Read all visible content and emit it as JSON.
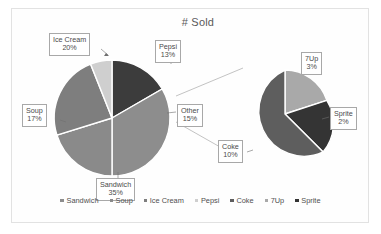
{
  "chart_data": {
    "type": "pie",
    "title": "# Sold",
    "subtype": "pie-of-pie",
    "xlabel": "",
    "ylabel": "",
    "legend_position": "bottom",
    "grid": false,
    "categories": [
      "Sandwich",
      "Soup",
      "Ice Cream",
      "Pepsi",
      "Other"
    ],
    "values": [
      35,
      17,
      20,
      13,
      15
    ],
    "value_unit": "%",
    "primary_pie": {
      "slices": [
        {
          "label": "Sandwich",
          "value": 35,
          "display": "35%",
          "color": "#8d8d8d"
        },
        {
          "label": "Soup",
          "value": 17,
          "display": "17%",
          "color": "#8a8a8a"
        },
        {
          "label": "Ice Cream",
          "value": 20,
          "display": "20%",
          "color": "#7e7e7e"
        },
        {
          "label": "Pepsi",
          "value": 13,
          "display": "13%",
          "color": "#cfcfcf"
        },
        {
          "label": "Other",
          "value": 15,
          "display": "15%",
          "color": "#3c3c3c"
        }
      ]
    },
    "secondary_pie": {
      "source_slice": "Other",
      "source_value": 15,
      "slices": [
        {
          "label": "Coke",
          "value": 10,
          "display": "10%",
          "color": "#5e5e5e"
        },
        {
          "label": "7Up",
          "value": 3,
          "display": "3%",
          "color": "#a9a9a9"
        },
        {
          "label": "Sprite",
          "value": 2,
          "display": "2%",
          "color": "#343434"
        }
      ]
    },
    "legend": [
      "Sandwich",
      "Soup",
      "Ice Cream",
      "Pepsi",
      "Coke",
      "7Up",
      "Sprite"
    ],
    "annotations": [
      "Ice Cream 20%",
      "Pepsi 13%",
      "Soup 17%",
      "Other 15%",
      "Sandwich 35%",
      "7Up 3%",
      "Sprite 2%",
      "Coke 10%"
    ]
  },
  "labels": {
    "ice_cream": {
      "name": "Ice Cream",
      "pct": "20%"
    },
    "pepsi": {
      "name": "Pepsi",
      "pct": "13%"
    },
    "soup": {
      "name": "Soup",
      "pct": "17%"
    },
    "other": {
      "name": "Other",
      "pct": "15%"
    },
    "sandwich": {
      "name": "Sandwich",
      "pct": "35%"
    },
    "sevenup": {
      "name": "7Up",
      "pct": "3%"
    },
    "sprite": {
      "name": "Sprite",
      "pct": "2%"
    },
    "coke": {
      "name": "Coke",
      "pct": "10%"
    }
  },
  "legend_items": [
    {
      "label": "Sandwich",
      "color": "#8d8d8d"
    },
    {
      "label": "Soup",
      "color": "#8a8a8a"
    },
    {
      "label": "Ice Cream",
      "color": "#7e7e7e"
    },
    {
      "label": "Pepsi",
      "color": "#cfcfcf"
    },
    {
      "label": "Coke",
      "color": "#5e5e5e"
    },
    {
      "label": "7Up",
      "color": "#a9a9a9"
    },
    {
      "label": "Sprite",
      "color": "#343434"
    }
  ],
  "colors": {
    "frame_border": "#e2e2e2",
    "background": "#ffffff",
    "label_border": "#a8a8a8",
    "text": "#4a4a4a",
    "title_text": "#5a5a5a",
    "slice_separator": "#ffffff",
    "leader_line": "#9a9a9a"
  }
}
